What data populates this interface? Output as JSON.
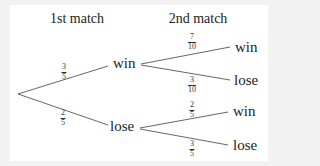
{
  "headers": {
    "first": "1st match",
    "second": "2nd match"
  },
  "first_match": {
    "win": {
      "label": "win",
      "prob": {
        "num": "3",
        "den": "5"
      }
    },
    "lose": {
      "label": "lose",
      "prob": {
        "num": "2",
        "den": "5"
      }
    }
  },
  "second_match": {
    "after_win": {
      "win": {
        "label": "win",
        "prob": {
          "num": "7",
          "den": "10"
        }
      },
      "lose": {
        "label": "lose",
        "prob": {
          "num": "3",
          "den": "10"
        }
      }
    },
    "after_lose": {
      "win": {
        "label": "win",
        "prob": {
          "num": "2",
          "den": "5"
        }
      },
      "lose": {
        "label": "lose",
        "prob": {
          "num": "3",
          "den": "5"
        }
      }
    }
  },
  "colors": {
    "background": "#f2f2f2",
    "panel": "#ffffff",
    "line": "#555555",
    "text": "#222222"
  }
}
